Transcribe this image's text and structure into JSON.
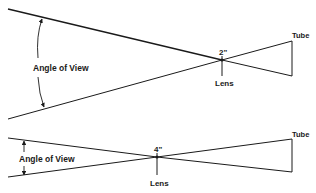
{
  "diagram": {
    "colors": {
      "background": "#ffffff",
      "ink": "#1a1a1a"
    },
    "top": {
      "angle_label": "Angle of View",
      "focal_label": "2\"",
      "lens_label": "Lens",
      "tube_label": "Tube"
    },
    "bottom": {
      "angle_label": "Angle of View",
      "focal_label": "4\"",
      "lens_label": "Lens",
      "tube_label": "Tube"
    }
  }
}
